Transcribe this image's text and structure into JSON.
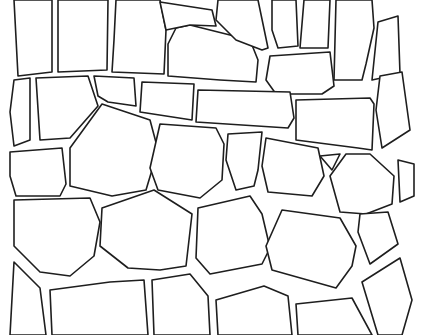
{
  "image": {
    "subject": "stone wall line drawing",
    "background_color": "#ffffff",
    "line_color": "#1e1e1e",
    "stones": [
      {
        "id": "top-1",
        "points": "20,0 52,0 52,72 18,76 14,0"
      },
      {
        "id": "top-2",
        "points": "58,0 108,0 107,70 58,72"
      },
      {
        "id": "top-3",
        "points": "116,0 160,0 166,30 164,74 112,72 114,40"
      },
      {
        "id": "top-4",
        "points": "176,28 190,25 250,40 258,60 256,82 220,80 168,76 168,44"
      },
      {
        "id": "top-5",
        "points": "218,0 258,0 268,48 262,50 236,40 216,20"
      },
      {
        "id": "top-6",
        "points": "272,0 296,0 298,46 278,48 272,30"
      },
      {
        "id": "top-7",
        "points": "304,0 330,0 328,48 300,48"
      },
      {
        "id": "top-8",
        "points": "336,0 372,0 374,28 366,64 362,80 334,80"
      },
      {
        "id": "top-9",
        "points": "378,22 398,16 400,74 372,80"
      },
      {
        "id": "top-10",
        "points": "270,56 330,52 334,86 322,94 276,94 266,80"
      },
      {
        "id": "top-11",
        "points": "160,2 212,10 216,26 190,25 166,30"
      },
      {
        "id": "row2-1",
        "points": "14,80 30,78 30,140 14,146 10,112"
      },
      {
        "id": "row2-2",
        "points": "36,78 88,76 98,106 70,138 40,140"
      },
      {
        "id": "row2-3",
        "points": "94,76 134,78 136,106 108,102 98,96"
      },
      {
        "id": "row2-4",
        "points": "142,82 194,84 192,120 140,112"
      },
      {
        "id": "row2-5",
        "points": "198,90 290,92 294,118 288,128 196,122"
      },
      {
        "id": "row2-6",
        "points": "296,100 370,98 374,104 372,150 358,148 296,140"
      },
      {
        "id": "row2-7",
        "points": "380,76 402,72 410,130 382,148 376,110"
      },
      {
        "id": "row3-1",
        "points": "10,152 62,148 66,184 60,196 16,196 10,176"
      },
      {
        "id": "row3-2",
        "points": "70,148 102,104 150,120 158,150 146,190 112,196 70,186"
      },
      {
        "id": "row3-3",
        "points": "160,124 216,128 224,144 222,180 200,198 158,190 150,168"
      },
      {
        "id": "row3-4",
        "points": "228,134 262,132 258,170 254,186 236,190 226,160"
      },
      {
        "id": "row3-5",
        "points": "266,138 318,148 324,176 312,196 268,192 262,166"
      },
      {
        "id": "row3-6",
        "points": "320,156 340,154 332,170"
      },
      {
        "id": "row3-7",
        "points": "330,176 346,154 370,154 394,176 392,204 366,214 340,212"
      },
      {
        "id": "row3-8",
        "points": "398,160 414,164 414,196 400,202"
      },
      {
        "id": "row4-1",
        "points": "14,200 90,198 100,222 94,256 70,276 40,272 14,246"
      },
      {
        "id": "row4-2",
        "points": "102,208 154,190 192,214 186,266 160,270 128,268 100,246"
      },
      {
        "id": "row4-3",
        "points": "198,208 250,196 262,214 270,248 262,264 210,274 196,258"
      },
      {
        "id": "row4-4",
        "points": "282,210 340,218 356,246 352,266 336,288 272,270 266,246"
      },
      {
        "id": "row4-5",
        "points": "360,214 388,212 398,244 370,264 358,232"
      },
      {
        "id": "row5-1",
        "points": "14,262 40,288 46,335 10,335"
      },
      {
        "id": "row5-2",
        "points": "50,290 110,282 144,280 148,335 52,335"
      },
      {
        "id": "row5-3",
        "points": "152,280 190,274 208,296 210,335 154,335"
      },
      {
        "id": "row5-4",
        "points": "216,300 264,286 288,296 292,335 218,335"
      },
      {
        "id": "row5-5",
        "points": "296,304 352,298 372,335 298,335"
      },
      {
        "id": "row5-6",
        "points": "362,282 400,258 412,300 402,335 378,335"
      }
    ]
  }
}
